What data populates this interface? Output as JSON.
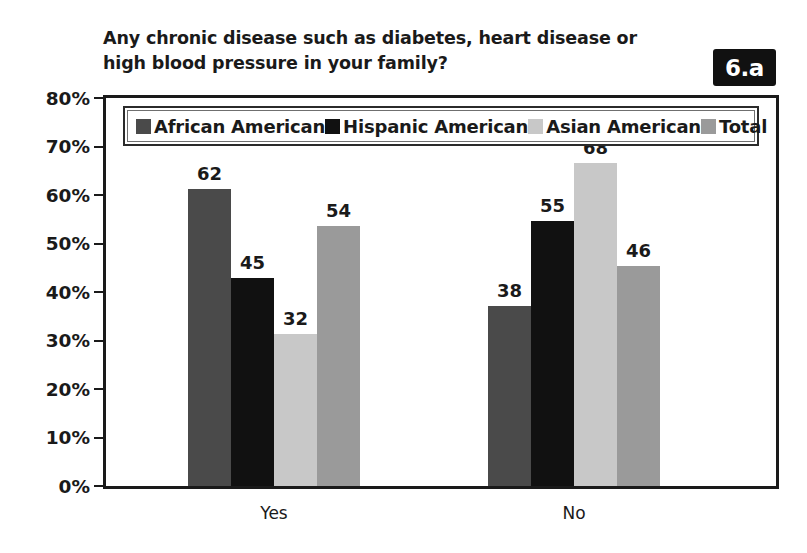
{
  "title": {
    "line1": "Any chronic disease such as diabetes, heart disease or",
    "line2": "high blood pressure in your family?"
  },
  "badge": {
    "label": "6.a",
    "background": "#111111",
    "text_color": "#ffffff"
  },
  "legend": {
    "position": "inside-top",
    "entries": [
      {
        "label": "African American",
        "color": "#4a4a4a"
      },
      {
        "label": "Hispanic American",
        "color": "#111111"
      },
      {
        "label": "Asian American",
        "color": "#c8c8c8"
      },
      {
        "label": "Total",
        "color": "#9a9a9a"
      }
    ]
  },
  "axes": {
    "y_ticks": [
      "80%",
      "70%",
      "60%",
      "50%",
      "40%",
      "30%",
      "20%",
      "10%",
      "0%"
    ],
    "y_tick_values": [
      80,
      70,
      60,
      50,
      40,
      30,
      20,
      10,
      0
    ],
    "x_categories": [
      "Yes",
      "No"
    ]
  },
  "chart_data": {
    "type": "bar",
    "title": "Any chronic disease such as diabetes, heart disease or high blood pressure in your family?",
    "xlabel": "",
    "ylabel": "",
    "ylim": [
      0,
      80
    ],
    "ytick_step": 10,
    "grid": false,
    "legend_position": "inside-top",
    "categories": [
      "Yes",
      "No"
    ],
    "series": [
      {
        "name": "African American",
        "color": "#4a4a4a",
        "values": [
          62,
          38
        ],
        "plotted": [
          61.3,
          37.1
        ]
      },
      {
        "name": "Hispanic American",
        "color": "#111111",
        "values": [
          45,
          55
        ],
        "plotted": [
          42.8,
          54.7
        ]
      },
      {
        "name": "Asian American",
        "color": "#c8c8c8",
        "values": [
          32,
          68
        ],
        "plotted": [
          31.4,
          66.6
        ]
      },
      {
        "name": "Total",
        "color": "#9a9a9a",
        "values": [
          54,
          46
        ],
        "plotted": [
          53.7,
          45.4
        ]
      }
    ],
    "data_labels": [
      [
        "62",
        "45",
        "32",
        "54"
      ],
      [
        "38",
        "55",
        "68",
        "46"
      ]
    ],
    "units": "percent"
  }
}
